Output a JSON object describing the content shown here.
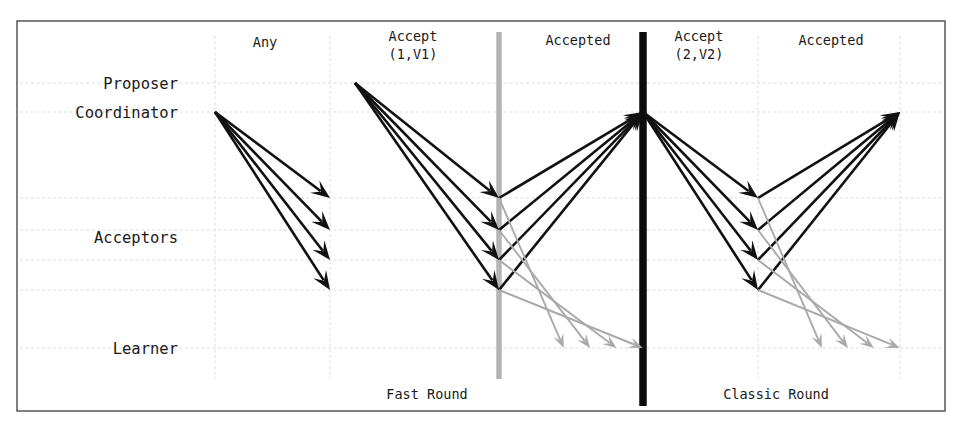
{
  "diagram": {
    "background_color": "#ffffff",
    "frame_color": "#4a4a4a",
    "grid_color": "#d8d8e2",
    "colors": {
      "dark_arrow": "#111111",
      "light_arrow": "#a9a9a9",
      "gray_bar": "#b4b4b4",
      "black_bar": "#0b0b0b"
    },
    "row_labels": [
      {
        "id": "proposer",
        "text": "Proposer",
        "y": 83
      },
      {
        "id": "coordinator",
        "text": "Coordinator",
        "y": 112
      },
      {
        "id": "acceptors",
        "text": "Acceptors",
        "y": 237
      },
      {
        "id": "learner",
        "text": "Learner",
        "y": 348
      }
    ],
    "phase_labels": [
      {
        "id": "any",
        "lines": [
          "Any"
        ],
        "x": 265,
        "y": 47
      },
      {
        "id": "accept-1-v1",
        "lines": [
          "Accept",
          "(1,V1)"
        ],
        "x": 413,
        "y": 41
      },
      {
        "id": "accepted-fast",
        "lines": [
          "Accepted"
        ],
        "x": 578,
        "y": 45
      },
      {
        "id": "accept-2-v2",
        "lines": [
          "Accept",
          "(2,V2)"
        ],
        "x": 699,
        "y": 41
      },
      {
        "id": "accepted-classic",
        "lines": [
          "Accepted"
        ],
        "x": 831,
        "y": 45
      }
    ],
    "round_labels": [
      {
        "id": "fast-round",
        "text": "Fast Round",
        "x": 427,
        "y": 399
      },
      {
        "id": "classic-round",
        "text": "Classic Round",
        "x": 776,
        "y": 399
      }
    ],
    "vertical_bars": [
      {
        "id": "fast-round-boundary",
        "x": 499,
        "y1": 32,
        "y2": 379,
        "style": "gray"
      },
      {
        "id": "classic-round-boundary",
        "x": 643,
        "y1": 32,
        "y2": 406,
        "style": "black"
      }
    ],
    "grid": {
      "horizontal_y": [
        83,
        112,
        198,
        230,
        260,
        290,
        348
      ],
      "vertical_x": [
        215,
        330,
        499,
        643,
        758,
        900
      ],
      "frame": {
        "x": 17,
        "y": 21,
        "width": 928,
        "height": 390
      }
    },
    "actor_rows": {
      "proposer_y": 83,
      "coordinator_y": 112,
      "acceptor_ys": [
        198,
        230,
        260,
        290
      ],
      "learner_y": 348
    },
    "message_groups": [
      {
        "id": "any-request",
        "label": "Any",
        "color": "dark",
        "from": {
          "x": 215,
          "y": 112
        },
        "to_x": 330,
        "to_ys": [
          198,
          230,
          260,
          290
        ]
      },
      {
        "id": "accept-1-v1-request",
        "label": "Accept (1,V1)",
        "color": "dark",
        "from": {
          "x": 355,
          "y": 83
        },
        "to_x": 499,
        "to_ys": [
          198,
          230,
          260,
          290
        ]
      },
      {
        "id": "accepted-fast-to-coordinator",
        "label": "Accepted",
        "color": "dark",
        "from_x": 499,
        "from_ys": [
          198,
          230,
          260,
          290
        ],
        "to": {
          "x": 643,
          "y": 112
        }
      },
      {
        "id": "accepted-fast-to-learner",
        "label": "Accepted",
        "color": "light",
        "from_x": 499,
        "from_ys": [
          198,
          230,
          260,
          290
        ],
        "to_x": 643,
        "to_y": 348
      },
      {
        "id": "accept-2-v2-request",
        "label": "Accept (2,V2)",
        "color": "dark",
        "from": {
          "x": 643,
          "y": 112
        },
        "to_x": 758,
        "to_ys": [
          198,
          230,
          260,
          290
        ]
      },
      {
        "id": "accepted-classic-to-coordinator",
        "label": "Accepted",
        "color": "dark",
        "from_x": 758,
        "from_ys": [
          198,
          230,
          260,
          290
        ],
        "to": {
          "x": 900,
          "y": 112
        }
      },
      {
        "id": "accepted-classic-to-learner",
        "label": "Accepted",
        "color": "light",
        "from_x": 758,
        "from_ys": [
          198,
          230,
          260,
          290
        ],
        "to_x": 900,
        "to_y": 348
      }
    ]
  }
}
